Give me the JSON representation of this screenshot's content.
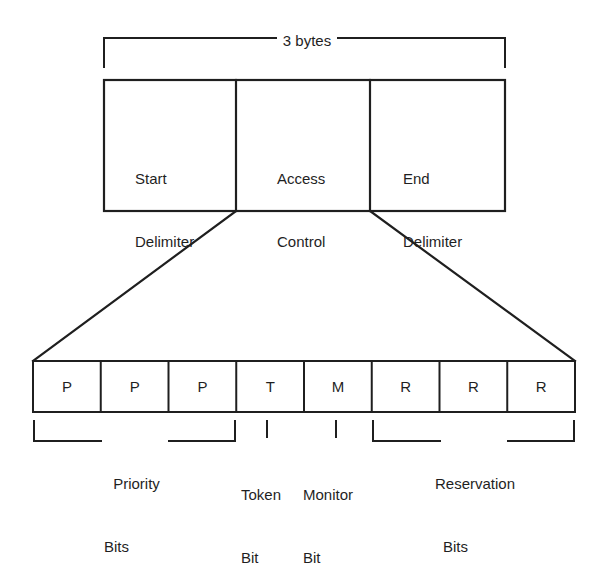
{
  "diagram": {
    "background_color": "#ffffff",
    "line_color": "#1f1f1f",
    "span": {
      "label": "3 bytes",
      "covers": [
        "Start Delimiter",
        "Access Control",
        "End Delimiter"
      ]
    },
    "fields": [
      {
        "id": "start-delimiter",
        "line1": "Start",
        "line2": "Delimiter"
      },
      {
        "id": "access-control",
        "line1": "Access",
        "line2": "Control"
      },
      {
        "id": "end-delimiter",
        "line1": "End",
        "line2": "Delimiter"
      }
    ],
    "expanded_field": "Access Control",
    "bits": [
      {
        "index": 0,
        "letter": "P"
      },
      {
        "index": 1,
        "letter": "P"
      },
      {
        "index": 2,
        "letter": "P"
      },
      {
        "index": 3,
        "letter": "T"
      },
      {
        "index": 4,
        "letter": "M"
      },
      {
        "index": 5,
        "letter": "R"
      },
      {
        "index": 6,
        "letter": "R"
      },
      {
        "index": 7,
        "letter": "R"
      }
    ],
    "bit_groups": [
      {
        "id": "priority-bits",
        "line1": "Priority",
        "line2": "Bits",
        "bit_span": [
          0,
          2
        ],
        "marker": "bracket"
      },
      {
        "id": "token-bit",
        "line1": "Token",
        "line2": "Bit",
        "bit_span": [
          3,
          3
        ],
        "marker": "tick"
      },
      {
        "id": "monitor-bit",
        "line1": "Monitor",
        "line2": "Bit",
        "bit_span": [
          4,
          4
        ],
        "marker": "tick"
      },
      {
        "id": "reservation-bits",
        "line1": "Reservation",
        "line2": "Bits",
        "bit_span": [
          5,
          7
        ],
        "marker": "bracket"
      }
    ]
  }
}
